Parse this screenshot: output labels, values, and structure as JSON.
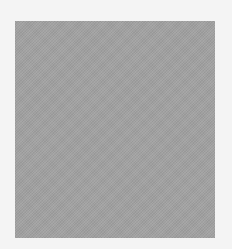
{
  "canvas": {
    "background_color": "#f4f4f4"
  },
  "swatch": {
    "color": "#a2a2a2",
    "description": "gray square"
  }
}
